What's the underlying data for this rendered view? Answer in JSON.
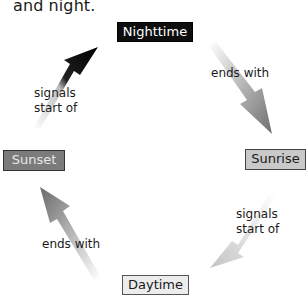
{
  "caption": "and night.",
  "nodes": {
    "top": "Nighttime",
    "right": "Sunrise",
    "bottom": "Daytime",
    "left": "Sunset"
  },
  "edges": [
    {
      "from": "Nighttime",
      "to": "Sunrise",
      "label": "ends with"
    },
    {
      "from": "Sunrise",
      "to": "Daytime",
      "label_line1": "signals",
      "label_line2": "start of"
    },
    {
      "from": "Daytime",
      "to": "Sunset",
      "label": "ends with"
    },
    {
      "from": "Sunset",
      "to": "Nighttime",
      "label_line1": "signals",
      "label_line2": "start of"
    }
  ],
  "colors": {
    "nighttime_fill": "#0d0d0d",
    "sunrise_fill": "#c9c9c9",
    "daytime_fill": "#ececec",
    "sunset_fill": "#7b7b7b"
  }
}
